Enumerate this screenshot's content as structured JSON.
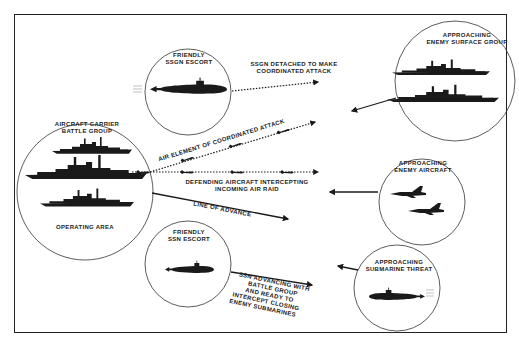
{
  "diagram": {
    "type": "naval-battle-group-tactical-diagram",
    "colors": {
      "ink": "#1a1a1a",
      "background": "#ffffff",
      "frame": "#222222"
    },
    "nodes": {
      "carrier_group": {
        "title_line1": "AIRCRAFT CARRIER",
        "title_line2": "BATTLE GROUP",
        "footer": "OPERATING AREA",
        "icon": "warship-silhouettes-icon"
      },
      "ssgn_escort": {
        "title_line1": "FRIENDLY",
        "title_line2": "SSGN ESCORT",
        "icon": "submarine-icon"
      },
      "ssn_escort": {
        "title_line1": "FRIENDLY",
        "title_line2": "SSN ESCORT",
        "icon": "submarine-icon"
      },
      "enemy_surface": {
        "title_line1": "APPROACHING",
        "title_line2": "ENEMY SURFACE GROUP",
        "icon": "warship-silhouettes-icon"
      },
      "enemy_aircraft": {
        "title_line1": "APPROACHING",
        "title_line2": "ENEMY AIRCRAFT",
        "icon": "fighter-jet-icon"
      },
      "enemy_submarine": {
        "title_line1": "APPROACHING",
        "title_line2": "SUBMARINE THREAT",
        "icon": "submarine-icon"
      }
    },
    "edges": {
      "ssgn_attack": {
        "line1": "SSGN DETACHED TO MAKE",
        "line2": "COORDINATED ATTACK",
        "style": "dotted-arrow"
      },
      "air_element": {
        "label": "AIR ELEMENT OF COORDINATED ATTACK",
        "style": "dotted-arrow"
      },
      "defending_aircraft": {
        "line1": "DEFENDING AIRCRAFT INTERCEPTING",
        "line2": "INCOMING AIR RAID",
        "style": "dotted-arrow"
      },
      "line_of_advance": {
        "label": "LINE OF ADVANCE",
        "style": "solid-arrow"
      },
      "ssn_advance": {
        "line1": "SSN ADVANCING WITH",
        "line2": "BATTLE GROUP",
        "line3": "AND READY TO",
        "line4": "INTERCEPT CLOSING",
        "line5": "ENEMY SUBMARINES",
        "style": "solid-arrow"
      }
    }
  }
}
